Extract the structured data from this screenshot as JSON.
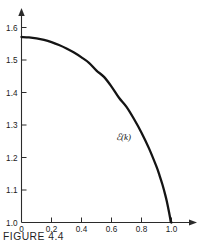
{
  "figure": {
    "caption": "FIGURE 4.4",
    "curve_label": "ℰ(k)"
  },
  "chart_data": {
    "type": "line",
    "title": "",
    "subtitle": "",
    "xlabel": "",
    "ylabel": "",
    "xlim": [
      0.0,
      1.0
    ],
    "ylim": [
      1.0,
      1.6
    ],
    "grid": false,
    "legend": false,
    "legend_position": "none",
    "annotations": [
      {
        "text": "ℰ(k)",
        "x": 0.68,
        "y": 1.255
      }
    ],
    "x_ticks": [
      0,
      0.2,
      0.4,
      0.6,
      0.8,
      1.0
    ],
    "x_tick_labels": [
      "0",
      "0.2",
      "0.4",
      "0.6",
      "0.8",
      "1.0"
    ],
    "y_ticks": [
      1.0,
      1.1,
      1.2,
      1.3,
      1.4,
      1.5,
      1.6
    ],
    "y_tick_labels": [
      "1.0",
      "1.1",
      "1.2",
      "1.3",
      "1.4",
      "1.5",
      "1.6"
    ],
    "series": [
      {
        "name": "ℰ(k)",
        "x": [
          0.0,
          0.05,
          0.1,
          0.15,
          0.2,
          0.25,
          0.3,
          0.35,
          0.4,
          0.45,
          0.5,
          0.55,
          0.6,
          0.65,
          0.7,
          0.75,
          0.8,
          0.85,
          0.9,
          0.92,
          0.94,
          0.96,
          0.97,
          0.98,
          0.99,
          0.995,
          0.999,
          1.0
        ],
        "y": [
          1.5708,
          1.5698,
          1.5668,
          1.5619,
          1.555,
          1.5462,
          1.5354,
          1.5228,
          1.5081,
          1.4914,
          1.4675,
          1.448,
          1.4181,
          1.3837,
          1.3557,
          1.3184,
          1.2764,
          1.2281,
          1.1717,
          1.1453,
          1.116,
          1.0819,
          1.0622,
          1.0401,
          1.016,
          1.0026,
          1.0,
          1.0
        ]
      }
    ]
  }
}
